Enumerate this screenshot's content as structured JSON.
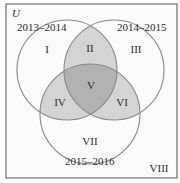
{
  "diagram": {
    "type": "venn-3",
    "universe_label": "U",
    "sets": [
      {
        "id": "A",
        "label": "2013–2014",
        "cx": 67,
        "cy": 70,
        "r": 50
      },
      {
        "id": "B",
        "label": "2014–2015",
        "cx": 114,
        "cy": 70,
        "r": 50
      },
      {
        "id": "C",
        "label": "2015–2016",
        "cx": 90,
        "cy": 114,
        "r": 50
      }
    ],
    "regions": [
      {
        "id": "I",
        "label": "I",
        "membership": "A only"
      },
      {
        "id": "II",
        "label": "II",
        "membership": "A and B only"
      },
      {
        "id": "III",
        "label": "III",
        "membership": "B only"
      },
      {
        "id": "IV",
        "label": "IV",
        "membership": "A and C only"
      },
      {
        "id": "V",
        "label": "V",
        "membership": "A, B and C"
      },
      {
        "id": "VI",
        "label": "VI",
        "membership": "B and C only"
      },
      {
        "id": "VII",
        "label": "VII",
        "membership": "C only"
      },
      {
        "id": "VIII",
        "label": "VIII",
        "membership": "none"
      }
    ],
    "colors": {
      "background": "#fbfbfb",
      "border": "#6e6e6e",
      "circle_stroke": "#888888",
      "pair_overlap_fill": "#d4d4d4",
      "triple_overlap_fill": "#b2b2b2",
      "text": "#2a2a2a"
    }
  }
}
